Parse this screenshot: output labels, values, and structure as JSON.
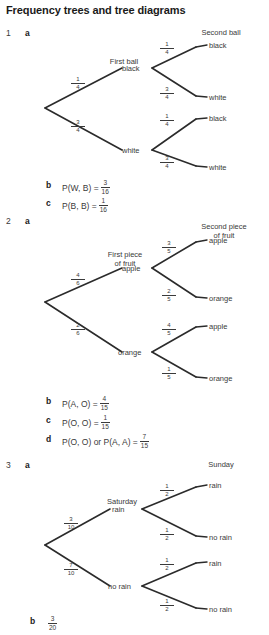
{
  "title": "Frequency trees and tree diagrams",
  "questions": [
    {
      "number": "1",
      "part_a": "a",
      "tree": {
        "stage1_header": "First ball",
        "stage2_header": "Second ball",
        "branch1_label": "black",
        "branch2_label": "white",
        "branch1_prob": {
          "num": "1",
          "den": "4"
        },
        "branch2_prob": {
          "num": "3",
          "den": "4"
        },
        "leaf1_label": "black",
        "leaf2_label": "white",
        "leaf3_label": "black",
        "leaf4_label": "white",
        "leaf1_prob": {
          "num": "1",
          "den": "4"
        },
        "leaf2_prob": {
          "num": "3",
          "den": "4"
        },
        "leaf3_prob": {
          "num": "1",
          "den": "4"
        },
        "leaf4_prob": {
          "num": "3",
          "den": "4"
        }
      },
      "answers": [
        {
          "letter": "b",
          "text": "P(W, B) =",
          "num": "3",
          "den": "16"
        },
        {
          "letter": "c",
          "text": "P(B, B) =",
          "num": "1",
          "den": "16"
        }
      ]
    },
    {
      "number": "2",
      "part_a": "a",
      "tree": {
        "stage1_header": "First piece",
        "stage1_header2": "of fruit",
        "stage2_header": "Second piece",
        "stage2_header2": "of fruit",
        "branch1_label": "apple",
        "branch2_label": "orange",
        "branch1_prob": {
          "num": "4",
          "den": "6"
        },
        "branch2_prob": {
          "num": "2",
          "den": "6"
        },
        "leaf1_label": "apple",
        "leaf2_label": "orange",
        "leaf3_label": "apple",
        "leaf4_label": "orange",
        "leaf1_prob": {
          "num": "3",
          "den": "5"
        },
        "leaf2_prob": {
          "num": "2",
          "den": "5"
        },
        "leaf3_prob": {
          "num": "4",
          "den": "5"
        },
        "leaf4_prob": {
          "num": "1",
          "den": "5"
        }
      },
      "answers": [
        {
          "letter": "b",
          "text": "P(A, O) =",
          "num": "4",
          "den": "15"
        },
        {
          "letter": "c",
          "text": "P(O, O) =",
          "num": "1",
          "den": "15"
        },
        {
          "letter": "d",
          "text": "P(O, O) or P(A, A) =",
          "num": "7",
          "den": "15"
        }
      ]
    },
    {
      "number": "3",
      "part_a": "a",
      "tree": {
        "stage1_header": "Saturday",
        "stage2_header": "Sunday",
        "branch1_label": "rain",
        "branch2_label": "no rain",
        "branch1_prob": {
          "num": "3",
          "den": "10"
        },
        "branch2_prob": {
          "num": "7",
          "den": "10"
        },
        "leaf1_label": "rain",
        "leaf2_label": "no rain",
        "leaf3_label": "rain",
        "leaf4_label": "no rain",
        "leaf1_prob": {
          "num": "1",
          "den": "2"
        },
        "leaf2_prob": {
          "num": "1",
          "den": "2"
        },
        "leaf3_prob": {
          "num": "1",
          "den": "2"
        },
        "leaf4_prob": {
          "num": "1",
          "den": "2"
        }
      },
      "answers": [
        {
          "letter": "b",
          "text": "",
          "num": "3",
          "den": "20"
        }
      ]
    }
  ]
}
